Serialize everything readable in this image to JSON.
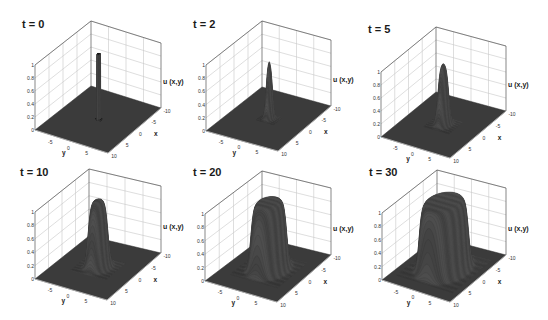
{
  "chart_data": {
    "type": "surface3d",
    "title": "",
    "zlabel": "u (x,y)",
    "xlabel": "x",
    "ylabel": "y",
    "zlim": [
      0,
      1
    ],
    "z_ticks": [
      "0",
      "0.2",
      "0.4",
      "0.6",
      "0.8",
      "1"
    ],
    "x_ticks": [
      "-10",
      "-5",
      "0",
      "5",
      "10"
    ],
    "y_ticks": [
      "-5",
      "0",
      "5"
    ],
    "x_range": [
      -10,
      10
    ],
    "y_range": [
      -10,
      10
    ],
    "grid": true,
    "panels": [
      {
        "label": "t = 0",
        "t": 0,
        "plateau_height": 1.0,
        "plateau_radius": 0.6,
        "edge_width": 0.05,
        "shape": "spike"
      },
      {
        "label": "t = 2",
        "t": 2,
        "plateau_height": 0.9,
        "plateau_radius": 0.7,
        "edge_width": 0.6,
        "shape": "bump"
      },
      {
        "label": "t = 5",
        "t": 5,
        "plateau_height": 0.95,
        "plateau_radius": 1.2,
        "edge_width": 0.8,
        "shape": "bump"
      },
      {
        "label": "t = 10",
        "t": 10,
        "plateau_height": 1.0,
        "plateau_radius": 2.2,
        "edge_width": 0.9,
        "shape": "plateau"
      },
      {
        "label": "t = 20",
        "t": 20,
        "plateau_height": 1.0,
        "plateau_radius": 4.0,
        "edge_width": 0.9,
        "shape": "plateau"
      },
      {
        "label": "t = 30",
        "t": 30,
        "plateau_height": 1.0,
        "plateau_radius": 5.6,
        "edge_width": 0.9,
        "shape": "plateau"
      }
    ]
  },
  "colors": {
    "floor": "#3b3b3b",
    "surface_dark": "#383838",
    "surface_light": "#8a8a8a",
    "grid": "#c8c8c8",
    "box": "#555555"
  }
}
